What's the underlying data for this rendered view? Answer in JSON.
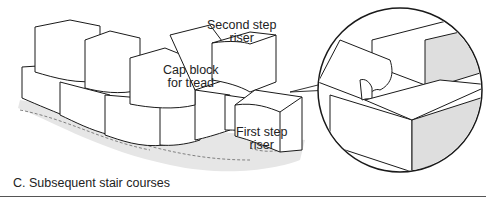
{
  "labels": {
    "second_step_riser": "Second step\nriser",
    "second_step_riser_l1": "Second step",
    "second_step_riser_l2": "riser",
    "cap_block_l1": "Cap block",
    "cap_block_l2": "for tread",
    "first_step_l1": "First step",
    "first_step_l2": "riser"
  },
  "caption": "C. Subsequent stair courses",
  "colors": {
    "stroke": "#1a1a1a",
    "shadow": "#e4e4e4",
    "shade": "#dcdcdc"
  }
}
